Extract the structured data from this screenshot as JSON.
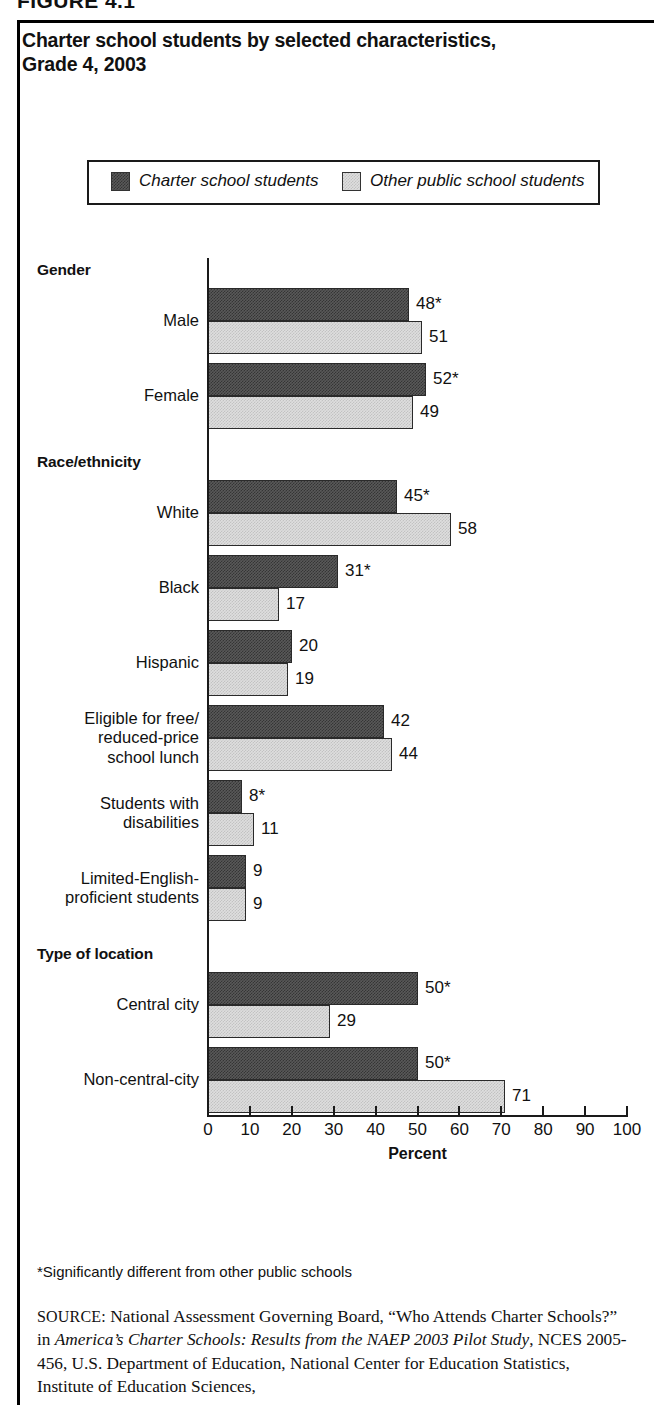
{
  "figure": {
    "number_label": "FIGURE 4.1",
    "title_line1": "Charter school students by selected characteristics,",
    "title_line2": "Grade 4, 2003"
  },
  "legend": {
    "series": [
      {
        "name": "charter",
        "label": "Charter school students",
        "color": "#595959"
      },
      {
        "name": "other",
        "label": "Other public school students",
        "color": "#dedede"
      }
    ]
  },
  "axis": {
    "title": "Percent",
    "ticks": [
      "0",
      "10",
      "20",
      "30",
      "40",
      "50",
      "60",
      "70",
      "80",
      "90",
      "100"
    ]
  },
  "sections": [
    {
      "header": "Gender"
    },
    {
      "header": "Race/ethnicity"
    },
    {
      "header": "Type of location"
    }
  ],
  "footnote": "*Significantly different from other public schools",
  "source": {
    "prefix": "SOURCE:",
    "part1": " National Assessment Governing Board, “Who Attends Charter Schools?” in ",
    "italic": "America’s Charter Schools: Results from the NAEP 2003 Pilot Study",
    "part2": ", NCES 2005-456, U.S. Department of Education, National Center for Education Statistics, Institute of Education Sciences,"
  },
  "chart_data": {
    "type": "bar",
    "orientation": "horizontal",
    "title": "Charter school students by selected characteristics, Grade 4, 2003",
    "xlabel": "Percent",
    "ylabel": "",
    "xlim": [
      0,
      100
    ],
    "xticks": [
      0,
      10,
      20,
      30,
      40,
      50,
      60,
      70,
      80,
      90,
      100
    ],
    "grid": false,
    "legend_position": "top",
    "series": [
      {
        "name": "Charter school students",
        "color": "#595959"
      },
      {
        "name": "Other public school students",
        "color": "#dedede"
      }
    ],
    "groups": [
      {
        "section": "Gender",
        "categories": [
          {
            "label": "Male",
            "label_lines": [
              "Male"
            ],
            "values": [
              48,
              51
            ],
            "labels": [
              "48*",
              "51"
            ],
            "significant": [
              true,
              false
            ]
          },
          {
            "label": "Female",
            "label_lines": [
              "Female"
            ],
            "values": [
              52,
              49
            ],
            "labels": [
              "52*",
              "49"
            ],
            "significant": [
              true,
              false
            ]
          }
        ]
      },
      {
        "section": "Race/ethnicity",
        "categories": [
          {
            "label": "White",
            "label_lines": [
              "White"
            ],
            "values": [
              45,
              58
            ],
            "labels": [
              "45*",
              "58"
            ],
            "significant": [
              true,
              false
            ]
          },
          {
            "label": "Black",
            "label_lines": [
              "Black"
            ],
            "values": [
              31,
              17
            ],
            "labels": [
              "31*",
              "17"
            ],
            "significant": [
              true,
              false
            ]
          },
          {
            "label": "Hispanic",
            "label_lines": [
              "Hispanic"
            ],
            "values": [
              20,
              19
            ],
            "labels": [
              "20",
              "19"
            ],
            "significant": [
              false,
              false
            ]
          },
          {
            "label": "Eligible for free/reduced-price school lunch",
            "label_lines": [
              "Eligible for free/",
              "reduced-price",
              "school lunch"
            ],
            "values": [
              42,
              44
            ],
            "labels": [
              "42",
              "44"
            ],
            "significant": [
              false,
              false
            ]
          },
          {
            "label": "Students with disabilities",
            "label_lines": [
              "Students with",
              "disabilities"
            ],
            "values": [
              8,
              11
            ],
            "labels": [
              "8*",
              "11"
            ],
            "significant": [
              true,
              false
            ]
          },
          {
            "label": "Limited-English-proficient students",
            "label_lines": [
              "Limited-English-",
              "proficient students"
            ],
            "values": [
              9,
              9
            ],
            "labels": [
              "9",
              "9"
            ],
            "significant": [
              false,
              false
            ]
          }
        ]
      },
      {
        "section": "Type of location",
        "categories": [
          {
            "label": "Central city",
            "label_lines": [
              "Central city"
            ],
            "values": [
              50,
              29
            ],
            "labels": [
              "50*",
              "29"
            ],
            "significant": [
              true,
              false
            ]
          },
          {
            "label": "Non-central-city",
            "label_lines": [
              "Non-central-city"
            ],
            "values": [
              50,
              71
            ],
            "labels": [
              "50*",
              "71"
            ],
            "significant": [
              true,
              false
            ]
          }
        ]
      }
    ]
  }
}
